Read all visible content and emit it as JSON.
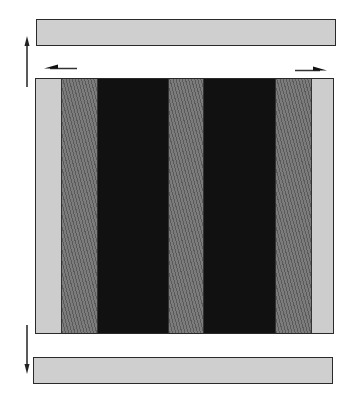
{
  "diagram": {
    "top_bar": {
      "x": 36,
      "y": 19,
      "w": 300,
      "h": 27,
      "fill": "#cfcfcf"
    },
    "main_block": {
      "x": 35,
      "y": 78,
      "w": 299,
      "h": 256,
      "stripes": [
        {
          "type": "light",
          "width": 25
        },
        {
          "type": "hatched",
          "width": 37
        },
        {
          "type": "dark",
          "width": 70
        },
        {
          "type": "hatched",
          "width": 36
        },
        {
          "type": "dark",
          "width": 71
        },
        {
          "type": "hatched",
          "width": 37
        },
        {
          "type": "light",
          "width": 23
        }
      ]
    },
    "bottom_bar": {
      "x": 33,
      "y": 357,
      "w": 300,
      "h": 27,
      "fill": "#cfcfcf"
    },
    "arrows": [
      {
        "name": "up-arrow",
        "x1": 27,
        "y1": 87,
        "x2": 27,
        "y2": 37,
        "direction": "up"
      },
      {
        "name": "left-arrow",
        "x1": 77,
        "y1": 68,
        "x2": 44,
        "y2": 68,
        "direction": "left"
      },
      {
        "name": "right-arrow",
        "x1": 295,
        "y1": 70,
        "x2": 327,
        "y2": 70,
        "direction": "right"
      },
      {
        "name": "down-arrow",
        "x1": 27,
        "y1": 325,
        "x2": 27,
        "y2": 373,
        "direction": "down"
      }
    ],
    "colors": {
      "light": "#cdcdcd",
      "hatched": "#6b6b6b",
      "dark": "#111111",
      "stroke": "#2a2a2a"
    }
  }
}
